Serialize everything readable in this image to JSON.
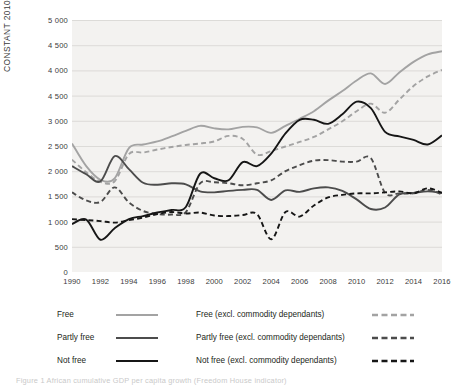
{
  "figure": {
    "caption": "Figure 1   African cumulative GDP per capita growth (Freedom House indicator)"
  },
  "chart_data": {
    "type": "line",
    "title": "",
    "xlabel": "",
    "ylabel": "CONSTANT 2010 US$",
    "xlim": [
      1990,
      2016
    ],
    "ylim": [
      0,
      5000
    ],
    "grid": true,
    "legend_position": "bottom",
    "y_ticks": [
      "5 000",
      "4 500",
      "4 000",
      "4 500",
      "3 000",
      "2 500",
      "2 000",
      "1 500",
      "1 000",
      "500",
      "0"
    ],
    "y_tick_values": [
      5000,
      4500,
      4000,
      3500,
      3000,
      2500,
      2000,
      1500,
      1000,
      500,
      0
    ],
    "x_ticks": [
      "1990",
      "1992",
      "1994",
      "1996",
      "1998",
      "2000",
      "2002",
      "2004",
      "2006",
      "2008",
      "2010",
      "2012",
      "2014",
      "2016"
    ],
    "x": [
      1990,
      1991,
      1992,
      1993,
      1994,
      1995,
      1996,
      1997,
      1998,
      1999,
      2000,
      2001,
      2002,
      2003,
      2004,
      2005,
      2006,
      2007,
      2008,
      2009,
      2010,
      2011,
      2012,
      2013,
      2014,
      2015,
      2016
    ],
    "series": [
      {
        "name": "Free",
        "color": "#a3a3a3",
        "style": "solid",
        "values": [
          2550,
          2100,
          1830,
          1860,
          2460,
          2530,
          2590,
          2690,
          2800,
          2900,
          2850,
          2830,
          2880,
          2870,
          2760,
          2900,
          3040,
          3190,
          3400,
          3590,
          3800,
          3940,
          3730,
          3960,
          4170,
          4320,
          4380
        ]
      },
      {
        "name": "Partly free",
        "color": "#4c4c4c",
        "style": "solid",
        "values": [
          2100,
          1940,
          1800,
          2300,
          2040,
          1770,
          1730,
          1760,
          1740,
          1600,
          1580,
          1610,
          1630,
          1630,
          1430,
          1620,
          1590,
          1660,
          1680,
          1610,
          1440,
          1250,
          1280,
          1540,
          1570,
          1600,
          1570
        ]
      },
      {
        "name": "Not free",
        "color": "#161616",
        "style": "solid",
        "values": [
          950,
          1040,
          640,
          870,
          1050,
          1110,
          1180,
          1230,
          1290,
          1950,
          1860,
          1820,
          2180,
          2100,
          2350,
          2750,
          3020,
          3020,
          2940,
          3130,
          3380,
          3250,
          2780,
          2690,
          2620,
          2530,
          2710
        ]
      },
      {
        "name": "Free (excl. commodity dependants)",
        "color": "#a3a3a3",
        "style": "dashed",
        "values": [
          2230,
          1980,
          1790,
          1800,
          2340,
          2370,
          2430,
          2480,
          2520,
          2550,
          2590,
          2700,
          2640,
          2330,
          2400,
          2490,
          2580,
          2680,
          2830,
          2990,
          3190,
          3340,
          3160,
          3420,
          3690,
          3880,
          4010
        ]
      },
      {
        "name": "Partly free (excl. commodity dependants)",
        "color": "#4c4c4c",
        "style": "dashed",
        "values": [
          1580,
          1420,
          1390,
          1680,
          1380,
          1210,
          1150,
          1140,
          1190,
          1760,
          1780,
          1760,
          1720,
          1760,
          1820,
          2000,
          2120,
          2210,
          2220,
          2190,
          2190,
          2260,
          1570,
          1560,
          1560,
          1630,
          1540
        ]
      },
      {
        "name": "Not free (excl. commodity dependants)",
        "color": "#161616",
        "style": "dashed",
        "values": [
          1050,
          1030,
          1010,
          980,
          1030,
          1080,
          1150,
          1190,
          1160,
          1180,
          1120,
          1110,
          1130,
          1150,
          650,
          1190,
          1100,
          1320,
          1480,
          1530,
          1560,
          1560,
          1580,
          1600,
          1560,
          1660,
          1570
        ]
      }
    ]
  },
  "legend": {
    "items": [
      {
        "label": "Free",
        "color": "#a3a3a3",
        "style": "solid",
        "column": "a",
        "row": 0
      },
      {
        "label": "Partly free",
        "color": "#4c4c4c",
        "style": "solid",
        "column": "a",
        "row": 1
      },
      {
        "label": "Not free",
        "color": "#161616",
        "style": "solid",
        "column": "a",
        "row": 2
      },
      {
        "label": "Free (excl. commodity dependants)",
        "color": "#a3a3a3",
        "style": "dashed",
        "column": "b",
        "row": 0
      },
      {
        "label": "Partly free (excl. commodity dependants)",
        "color": "#4c4c4c",
        "style": "dashed",
        "column": "b",
        "row": 1
      },
      {
        "label": "Not free (excl. commodity dependants)",
        "color": "#161616",
        "style": "dashed",
        "column": "b",
        "row": 2
      }
    ]
  }
}
